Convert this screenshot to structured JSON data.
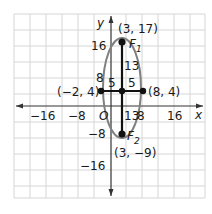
{
  "axes": {
    "x_label": "x",
    "y_label": "y",
    "origin_label": "O",
    "x_ticks": [
      "−16",
      "−8",
      "8",
      "16"
    ],
    "y_ticks": [
      "16",
      "8",
      "−8",
      "−16"
    ]
  },
  "points": {
    "top_focus": {
      "label": "F",
      "sub": "1",
      "coord": "(3, 17)"
    },
    "bottom_focus": {
      "label": "F",
      "sub": "2",
      "coord": "(3, −9)"
    },
    "left": {
      "coord": "(−2, 4)"
    },
    "right": {
      "coord": "(8, 4)"
    }
  },
  "segments": {
    "left_half": "5",
    "right_half": "5",
    "upper": "13",
    "lower": "13"
  },
  "colors": {
    "grid": "#d4d4d4",
    "axis": "#333333",
    "ellipse": "#808080",
    "segment": "#111111"
  }
}
